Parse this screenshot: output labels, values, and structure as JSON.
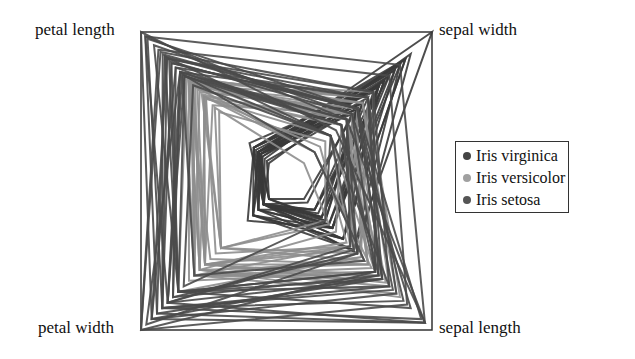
{
  "chart_data": {
    "type": "radar",
    "subtype": "radviz-like quadrilateral polylines",
    "title": "",
    "axes": [
      {
        "name": "petal length",
        "corner": "top-left",
        "range": [
          1.0,
          6.9
        ]
      },
      {
        "name": "sepal width",
        "corner": "top-right",
        "range": [
          2.0,
          4.4
        ]
      },
      {
        "name": "sepal length",
        "corner": "bottom-right",
        "range": [
          4.3,
          7.9
        ]
      },
      {
        "name": "petal width",
        "corner": "bottom-left",
        "range": [
          0.1,
          2.5
        ]
      }
    ],
    "legend": {
      "position": "right",
      "entries": [
        {
          "label": "Iris virginica",
          "color": "#444444"
        },
        {
          "label": "Iris versicolor",
          "color": "#9a9a9a"
        },
        {
          "label": "Iris setosa",
          "color": "#555555"
        }
      ]
    },
    "series": [
      {
        "name": "Iris setosa",
        "color": "#3a3a3a",
        "samples": [
          [
            5.1,
            3.5,
            1.4,
            0.2
          ],
          [
            4.9,
            3.0,
            1.4,
            0.2
          ],
          [
            4.7,
            3.2,
            1.3,
            0.2
          ],
          [
            4.6,
            3.1,
            1.5,
            0.2
          ],
          [
            5.0,
            3.6,
            1.4,
            0.2
          ],
          [
            5.4,
            3.9,
            1.7,
            0.4
          ],
          [
            4.6,
            3.4,
            1.4,
            0.3
          ],
          [
            5.0,
            3.4,
            1.5,
            0.2
          ],
          [
            4.4,
            2.9,
            1.4,
            0.2
          ],
          [
            4.9,
            3.1,
            1.5,
            0.1
          ],
          [
            5.4,
            3.7,
            1.5,
            0.2
          ],
          [
            4.8,
            3.4,
            1.6,
            0.2
          ],
          [
            4.8,
            3.0,
            1.4,
            0.1
          ],
          [
            4.3,
            3.0,
            1.1,
            0.1
          ],
          [
            5.8,
            4.0,
            1.2,
            0.2
          ],
          [
            5.7,
            4.4,
            1.5,
            0.4
          ],
          [
            5.4,
            3.9,
            1.3,
            0.4
          ],
          [
            5.1,
            3.5,
            1.4,
            0.3
          ],
          [
            5.7,
            3.8,
            1.7,
            0.3
          ],
          [
            5.1,
            3.8,
            1.5,
            0.3
          ],
          [
            5.4,
            3.4,
            1.7,
            0.2
          ],
          [
            5.1,
            3.7,
            1.5,
            0.4
          ],
          [
            4.6,
            3.6,
            1.0,
            0.2
          ],
          [
            5.1,
            3.3,
            1.7,
            0.5
          ],
          [
            4.8,
            3.4,
            1.9,
            0.2
          ]
        ]
      },
      {
        "name": "Iris versicolor",
        "color": "#8e8e8e",
        "samples": [
          [
            7.0,
            3.2,
            4.7,
            1.4
          ],
          [
            6.4,
            3.2,
            4.5,
            1.5
          ],
          [
            6.9,
            3.1,
            4.9,
            1.5
          ],
          [
            5.5,
            2.3,
            4.0,
            1.3
          ],
          [
            6.5,
            2.8,
            4.6,
            1.5
          ],
          [
            5.7,
            2.8,
            4.5,
            1.3
          ],
          [
            6.3,
            3.3,
            4.7,
            1.6
          ],
          [
            4.9,
            2.4,
            3.3,
            1.0
          ],
          [
            6.6,
            2.9,
            4.6,
            1.3
          ],
          [
            5.2,
            2.7,
            3.9,
            1.4
          ],
          [
            5.0,
            2.0,
            3.5,
            1.0
          ],
          [
            5.9,
            3.0,
            4.2,
            1.5
          ],
          [
            6.0,
            2.2,
            4.0,
            1.0
          ],
          [
            6.1,
            2.9,
            4.7,
            1.4
          ],
          [
            5.6,
            2.9,
            3.6,
            1.3
          ],
          [
            6.7,
            3.1,
            4.4,
            1.4
          ],
          [
            5.6,
            3.0,
            4.5,
            1.5
          ],
          [
            5.8,
            2.7,
            4.1,
            1.0
          ],
          [
            6.2,
            2.2,
            4.5,
            1.5
          ],
          [
            5.6,
            2.5,
            3.9,
            1.1
          ],
          [
            5.9,
            3.2,
            4.8,
            1.8
          ],
          [
            6.1,
            2.8,
            4.0,
            1.3
          ],
          [
            6.3,
            2.5,
            4.9,
            1.5
          ],
          [
            6.1,
            2.8,
            4.7,
            1.2
          ],
          [
            6.4,
            2.9,
            4.3,
            1.3
          ]
        ]
      },
      {
        "name": "Iris virginica",
        "color": "#4a4a4a",
        "samples": [
          [
            6.3,
            3.3,
            6.0,
            2.5
          ],
          [
            5.8,
            2.7,
            5.1,
            1.9
          ],
          [
            7.1,
            3.0,
            5.9,
            2.1
          ],
          [
            6.3,
            2.9,
            5.6,
            1.8
          ],
          [
            6.5,
            3.0,
            5.8,
            2.2
          ],
          [
            7.6,
            3.0,
            6.6,
            2.1
          ],
          [
            4.9,
            2.5,
            4.5,
            1.7
          ],
          [
            7.3,
            2.9,
            6.3,
            1.8
          ],
          [
            6.7,
            2.5,
            5.8,
            1.8
          ],
          [
            7.2,
            3.6,
            6.1,
            2.5
          ],
          [
            6.5,
            3.2,
            5.1,
            2.0
          ],
          [
            6.4,
            2.7,
            5.3,
            1.9
          ],
          [
            6.8,
            3.0,
            5.5,
            2.1
          ],
          [
            5.7,
            2.5,
            5.0,
            2.0
          ],
          [
            5.8,
            2.8,
            5.1,
            2.4
          ],
          [
            6.4,
            3.2,
            5.3,
            2.3
          ],
          [
            6.5,
            3.0,
            5.5,
            1.8
          ],
          [
            7.7,
            3.8,
            6.7,
            2.2
          ],
          [
            7.7,
            2.6,
            6.9,
            2.3
          ],
          [
            6.0,
            2.2,
            5.0,
            1.5
          ],
          [
            6.9,
            3.2,
            5.7,
            2.3
          ],
          [
            5.6,
            2.8,
            4.9,
            2.0
          ],
          [
            7.7,
            2.8,
            6.7,
            2.0
          ],
          [
            6.3,
            2.7,
            4.9,
            1.8
          ],
          [
            6.7,
            3.3,
            5.7,
            2.1
          ]
        ]
      }
    ],
    "sample_fields": [
      "sepal length",
      "sepal width",
      "petal length",
      "petal width"
    ],
    "grid": false,
    "frame": "square connecting the four axis corners"
  }
}
